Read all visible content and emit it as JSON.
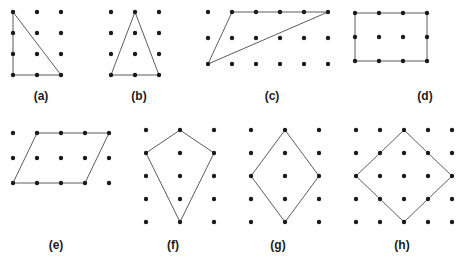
{
  "page": {
    "background_color": "#ffffff",
    "dot_color": "#1a1a1a",
    "line_color": "#4a4a4a",
    "label_color": "#1b1b1b",
    "dot_radius": 2.2,
    "line_width": 0.9,
    "width": 464,
    "height": 260
  },
  "figures": [
    {
      "id": "a",
      "label": "(a)",
      "shape": "right-triangle",
      "label_x": 41,
      "label_y": 89,
      "origin_x": 13,
      "origin_y": 12,
      "step_x": 24,
      "step_y": 21,
      "cols": 3,
      "rows": 4,
      "polygon": [
        [
          0,
          0
        ],
        [
          0,
          3
        ],
        [
          2,
          3
        ]
      ]
    },
    {
      "id": "b",
      "label": "(b)",
      "shape": "isosceles-triangle",
      "label_x": 139,
      "label_y": 89,
      "origin_x": 111,
      "origin_y": 12,
      "step_x": 24,
      "step_y": 21,
      "cols": 3,
      "rows": 4,
      "polygon": [
        [
          1,
          0
        ],
        [
          0,
          3
        ],
        [
          2,
          3
        ]
      ]
    },
    {
      "id": "c",
      "label": "(c)",
      "shape": "oblique-triangle",
      "label_x": 272,
      "label_y": 89,
      "origin_x": 208,
      "origin_y": 12,
      "step_x": 24,
      "step_y": 26,
      "cols": 6,
      "rows": 3,
      "polygon": [
        [
          1,
          0
        ],
        [
          5,
          0
        ],
        [
          0,
          2
        ]
      ]
    },
    {
      "id": "d",
      "label": "(d)",
      "shape": "rectangle",
      "label_x": 425,
      "label_y": 89,
      "origin_x": 355,
      "origin_y": 13,
      "step_x": 24,
      "step_y": 24,
      "cols": 4,
      "rows": 3,
      "polygon": [
        [
          0,
          0
        ],
        [
          3,
          0
        ],
        [
          3,
          2
        ],
        [
          0,
          2
        ]
      ]
    },
    {
      "id": "e",
      "label": "(e)",
      "shape": "parallelogram",
      "label_x": 56,
      "label_y": 238,
      "origin_x": 13,
      "origin_y": 133,
      "step_x": 24,
      "step_y": 25,
      "cols": 5,
      "rows": 3,
      "polygon": [
        [
          1,
          0
        ],
        [
          4,
          0
        ],
        [
          3,
          2
        ],
        [
          0,
          2
        ]
      ]
    },
    {
      "id": "f",
      "label": "(f)",
      "shape": "kite",
      "label_x": 173,
      "label_y": 238,
      "origin_x": 146,
      "origin_y": 130,
      "step_x": 34,
      "step_y": 23,
      "cols": 3,
      "rows": 5,
      "polygon": [
        [
          1,
          0
        ],
        [
          2,
          1
        ],
        [
          1,
          4
        ],
        [
          0,
          1
        ]
      ]
    },
    {
      "id": "g",
      "label": "(g)",
      "shape": "rhombus",
      "label_x": 278,
      "label_y": 238,
      "origin_x": 251,
      "origin_y": 130,
      "step_x": 34,
      "step_y": 23,
      "cols": 3,
      "rows": 5,
      "polygon": [
        [
          1,
          0
        ],
        [
          2,
          2
        ],
        [
          1,
          4
        ],
        [
          0,
          2
        ]
      ]
    },
    {
      "id": "h",
      "label": "(h)",
      "shape": "square-diamond",
      "label_x": 402,
      "label_y": 238,
      "origin_x": 356,
      "origin_y": 130,
      "step_x": 24,
      "step_y": 23,
      "cols": 5,
      "rows": 5,
      "polygon": [
        [
          2,
          0
        ],
        [
          4,
          2
        ],
        [
          2,
          4
        ],
        [
          0,
          2
        ]
      ]
    }
  ]
}
